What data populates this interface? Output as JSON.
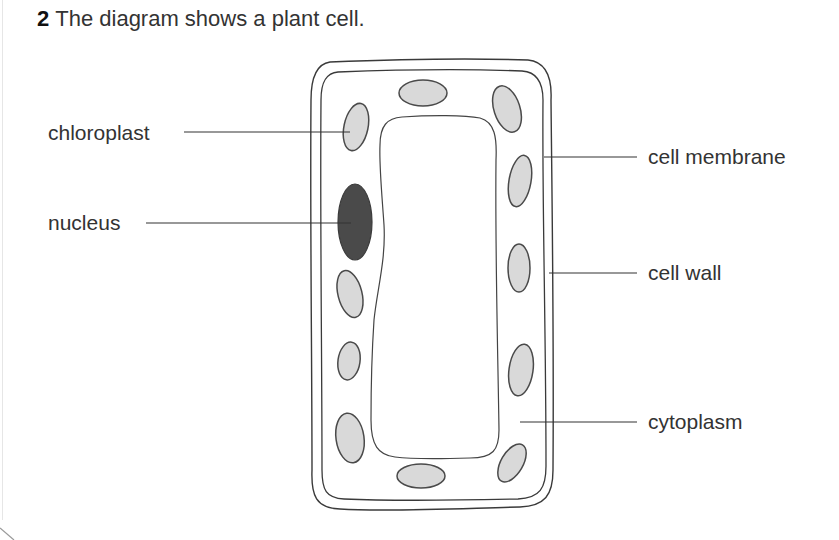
{
  "question": {
    "number": "2",
    "text": "The diagram shows a plant cell."
  },
  "diagram": {
    "title": "Plant cell",
    "labels": {
      "chloroplast": "chloroplast",
      "nucleus": "nucleus",
      "cell_membrane": "cell membrane",
      "cell_wall": "cell wall",
      "cytoplasm": "cytoplasm"
    },
    "colors": {
      "outline": "#3a3a3a",
      "chloroplast_fill": "#d9d9d9",
      "nucleus_fill": "#4a4a4a",
      "leader_line": "#333333",
      "text": "#333333"
    }
  }
}
